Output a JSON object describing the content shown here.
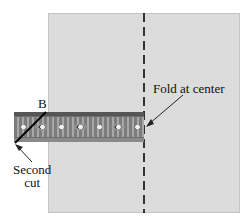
{
  "diagram": {
    "labels": {
      "point_b": "B",
      "fold": "Fold at center",
      "second_cut_line1": "Second",
      "second_cut_line2": "cut"
    },
    "colors": {
      "panel": "#dcdcdc",
      "fold_line": "#333333",
      "band": "#6f6f6f",
      "text": "#111111"
    }
  }
}
